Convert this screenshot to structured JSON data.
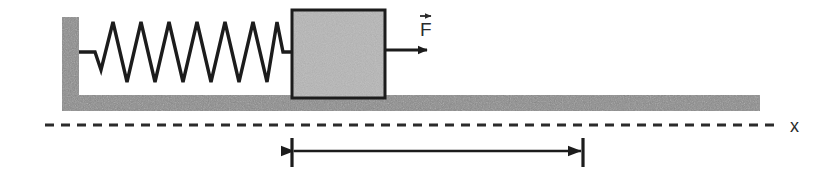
{
  "figure": {
    "kind": "physics-free-body-diagram",
    "width": 832,
    "height": 178,
    "background_color": "#ffffff"
  },
  "labels": {
    "force": "F",
    "force_symbol_description": "vector-arrow-over-F",
    "axis": "x"
  },
  "colors": {
    "support_gray": "#8a8a8a",
    "support_gray_dark": "#7a7a7a",
    "block_gray": "#b6b6b6",
    "block_gray_dark": "#a8a8a8",
    "outline_black": "#1c1c1c",
    "text_black": "#2b2b2b",
    "background": "#ffffff"
  },
  "geometry": {
    "wall": {
      "x": 62,
      "y": 17,
      "width": 17,
      "height": 93
    },
    "floor": {
      "x": 62,
      "y": 95,
      "width": 698,
      "height": 16
    },
    "block": {
      "x": 292,
      "y": 10,
      "width": 93,
      "height": 88
    },
    "spring": {
      "start_x": 79,
      "end_x": 292,
      "center_y": 52,
      "peaks": 7,
      "amplitude": 30
    },
    "force_arrow": {
      "x1": 385,
      "y": 50,
      "x2": 427
    },
    "axis_line": {
      "x1": 45,
      "x2": 775,
      "y": 125,
      "dash": "9 7"
    },
    "dimension": {
      "x1": 292,
      "x2": 583,
      "y": 150,
      "tick_top": 138,
      "tick_bottom": 167
    }
  },
  "elements": {
    "wall_name": "Fixed vertical wall",
    "floor_name": "Horizontal ground surface",
    "block_name": "Mass block",
    "spring_name": "Coil spring",
    "force_arrow_name": "Applied force arrow",
    "axis_name": "Horizontal displacement axis",
    "dimension_name": "Displacement measurement span"
  }
}
